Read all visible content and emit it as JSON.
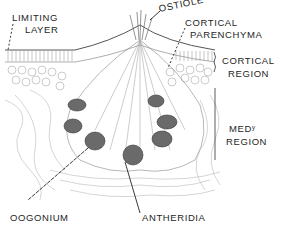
{
  "figure": {
    "type": "botanical cross-section illustration (conceptacle)",
    "labels": {
      "limiting_layer_1": "LIMITING",
      "limiting_layer_2": "LAYER",
      "ostiole": "OSTIOLE",
      "cortical_parenchyma_1": "CORTICAL",
      "cortical_parenchyma_2": "PARENCHYMA",
      "cortical_region_1": "CORTICAL",
      "cortical_region_2": "REGION",
      "medullary_region_1": "MEDʸ",
      "medullary_region_2": "REGION",
      "oogonium": "OOGONIUM",
      "antheridia": "ANTHERIDIA"
    },
    "colors": {
      "ink": "#1e1e1e",
      "tissue": "#8a8a8a",
      "dark_cells": "#4a4a4a",
      "background": "#ffffff"
    }
  }
}
